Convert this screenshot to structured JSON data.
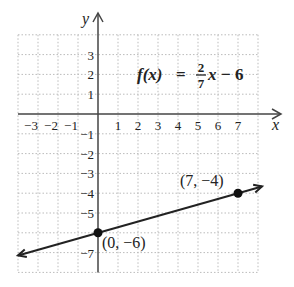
{
  "chart_data": {
    "type": "line",
    "title": "",
    "function_label": {
      "name": "f(x)",
      "equals": "=",
      "numerator": "2",
      "denominator": "7",
      "variable": "x",
      "rest": "− 6"
    },
    "xlabel": "x",
    "ylabel": "y",
    "xlim": [
      -4,
      8
    ],
    "ylim": [
      -8,
      4
    ],
    "grid": true,
    "x_ticks": [
      "−3",
      "−2",
      "−1",
      "1",
      "2",
      "3",
      "4",
      "5",
      "6",
      "7"
    ],
    "x_tick_values": [
      -3,
      -2,
      -1,
      1,
      2,
      3,
      4,
      5,
      6,
      7
    ],
    "y_ticks": [
      "3",
      "2",
      "1",
      "−1",
      "−2",
      "−3",
      "−4",
      "−5",
      "−7"
    ],
    "y_tick_values": [
      3,
      2,
      1,
      -1,
      -2,
      -3,
      -4,
      -5,
      -7
    ],
    "series": [
      {
        "name": "f(x) = (2/7)x − 6",
        "slope": 0.2857,
        "intercept": -6,
        "x_range": [
          -4,
          8.2
        ],
        "color": "#222222",
        "arrows": "both"
      }
    ],
    "points": [
      {
        "x": 0,
        "y": -6,
        "label": "(0, −6)"
      },
      {
        "x": 7,
        "y": -4,
        "label": "(7, −4)"
      }
    ]
  },
  "colors": {
    "axis": "#444444",
    "grid": "#bbbbbb",
    "line": "#222222",
    "text": "#222222"
  }
}
